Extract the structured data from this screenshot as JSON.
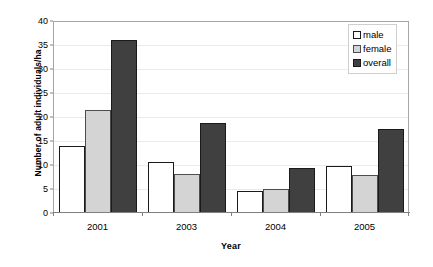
{
  "chart_data": {
    "type": "bar",
    "title": "",
    "subtitle": "",
    "xlabel": "Year",
    "ylabel": "Number of adult individuals/ha",
    "categories": [
      "2001",
      "2003",
      "2004",
      "2005"
    ],
    "series": [
      {
        "name": "male",
        "color": "#ffffff",
        "values": [
          14.0,
          10.7,
          4.5,
          9.8
        ]
      },
      {
        "name": "female",
        "color": "#d4d4d4",
        "values": [
          21.5,
          8.1,
          5.0,
          8.0
        ]
      },
      {
        "name": "overall",
        "color": "#404040",
        "values": [
          36.0,
          18.7,
          9.3,
          17.6
        ]
      }
    ],
    "ylim": [
      0,
      40
    ],
    "yticks": [
      0,
      5,
      10,
      15,
      20,
      25,
      30,
      35,
      40
    ],
    "ytick_labels": [
      "0",
      "5",
      "10",
      "15",
      "20",
      "25",
      "30",
      "35",
      "40"
    ],
    "grid": true,
    "legend_position": "top-right",
    "legend_entries": [
      "male",
      "female",
      "overall"
    ]
  },
  "axes": {
    "y_title": "Number of adult individuals/ha",
    "x_title": "Year"
  }
}
